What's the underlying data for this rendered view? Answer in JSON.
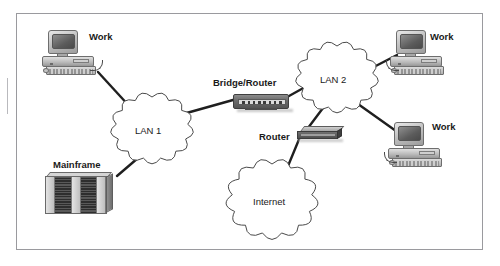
{
  "figure": {
    "background_color": "#ffffff",
    "frame_border_color": "#9a9a9e",
    "link_color": "#1f1f1f",
    "cloud_outline_color": "#4a4a4a"
  },
  "nodes": [
    {
      "id": "work-top-left",
      "type": "workstation",
      "label": "Work",
      "label_x": 89,
      "label_y": 32,
      "sprite_x": 40,
      "sprite_y": 30
    },
    {
      "id": "mainframe",
      "type": "mainframe",
      "label": "Mainframe",
      "label_x": 53,
      "label_y": 160,
      "sprite_x": 45,
      "sprite_y": 172
    },
    {
      "id": "lan-1",
      "type": "cloud",
      "label": "LAN 1",
      "label_x": 135,
      "label_y": 126,
      "center_x": 152,
      "center_y": 128,
      "radius_x": 36,
      "radius_y": 31
    },
    {
      "id": "bridge-router",
      "type": "rack-device",
      "label": "Bridge/Router",
      "label_x": 213,
      "label_y": 78,
      "sprite_x": 233,
      "sprite_y": 92
    },
    {
      "id": "lan-2",
      "type": "cloud",
      "label": "LAN 2",
      "label_x": 320,
      "label_y": 75,
      "center_x": 337,
      "center_y": 77,
      "radius_x": 36,
      "radius_y": 31
    },
    {
      "id": "router",
      "type": "flat-router",
      "label": "Router",
      "label_x": 259,
      "label_y": 132,
      "sprite_x": 297,
      "sprite_y": 126
    },
    {
      "id": "internet",
      "type": "cloud",
      "label": "Internet",
      "label_x": 253,
      "label_y": 197,
      "center_x": 272,
      "center_y": 199,
      "radius_x": 40,
      "radius_y": 35
    },
    {
      "id": "work-top-right",
      "type": "workstation",
      "label": "Work",
      "label_x": 430,
      "label_y": 32,
      "sprite_x": 388,
      "sprite_y": 30
    },
    {
      "id": "work-bottom-right",
      "type": "workstation",
      "label": "Work",
      "label_x": 432,
      "label_y": 122,
      "sprite_x": 386,
      "sprite_y": 122
    }
  ],
  "links": [
    {
      "id": "link-work-topleft-lan1",
      "from": "work-top-left",
      "to": "lan-1",
      "x1": 98,
      "y1": 72,
      "x2": 131,
      "y2": 108
    },
    {
      "id": "link-mainframe-lan1",
      "from": "mainframe",
      "to": "lan-1",
      "x1": 117,
      "y1": 176,
      "x2": 145,
      "y2": 152
    },
    {
      "id": "link-lan1-bridgerouter",
      "from": "lan-1",
      "to": "bridge-router",
      "x1": 183,
      "y1": 114,
      "x2": 233,
      "y2": 100
    },
    {
      "id": "link-bridgerouter-lan2",
      "from": "bridge-router",
      "to": "lan-2",
      "x1": 289,
      "y1": 96,
      "x2": 307,
      "y2": 86
    },
    {
      "id": "link-lan2-work-topright",
      "from": "lan-2",
      "to": "work-top-right",
      "x1": 368,
      "y1": 70,
      "x2": 397,
      "y2": 55
    },
    {
      "id": "link-lan2-work-botright",
      "from": "lan-2",
      "to": "work-bottom-right",
      "x1": 358,
      "y1": 104,
      "x2": 396,
      "y2": 131
    },
    {
      "id": "link-lan2-router",
      "from": "lan-2",
      "to": "router",
      "x1": 323,
      "y1": 108,
      "x2": 308,
      "y2": 128
    },
    {
      "id": "link-router-internet",
      "from": "router",
      "to": "internet",
      "x1": 300,
      "y1": 137,
      "x2": 288,
      "y2": 166
    }
  ]
}
